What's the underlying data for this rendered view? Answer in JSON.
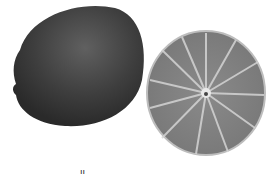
{
  "image": {
    "subject": "lime whole and halved",
    "colors": {
      "background": "#ffffff",
      "whole_lime": "#3a3a3a",
      "whole_lime_highlight": "#5e5e5e",
      "slice_flesh": "#7a7a7a",
      "slice_rind": "#6a6a6a",
      "slice_segments": "#d8d8d8"
    }
  },
  "caption_fragment": "li"
}
